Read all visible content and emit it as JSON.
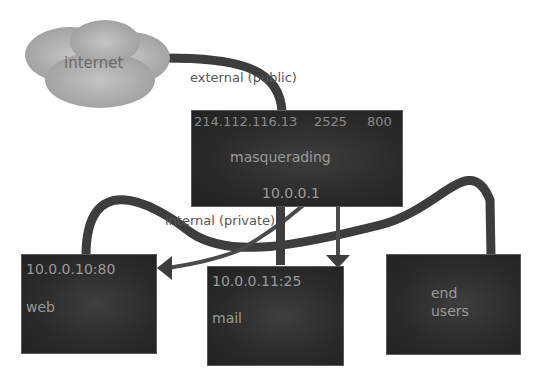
{
  "diagram": {
    "nodes": {
      "internet": {
        "label": "internet"
      },
      "router": {
        "public_ip": "214.112.116.13",
        "port_1": "2525",
        "port_2": "800",
        "role": "masquerading",
        "private_ip": "10.0.0.1"
      },
      "web": {
        "address": "10.0.0.10:80",
        "label": "web"
      },
      "mail": {
        "address": "10.0.0.11:25",
        "label": "mail"
      },
      "end_users": {
        "line1": "end",
        "line2": "users"
      }
    },
    "edge_labels": {
      "external": "external (public)",
      "internal": "internal (private)"
    },
    "colors": {
      "box_fill": "#2a2a2a",
      "box_text": "#9a9a9a",
      "link": "#3d3d3d",
      "cloud": "#a8a8a8",
      "label_text": "#555555"
    }
  }
}
